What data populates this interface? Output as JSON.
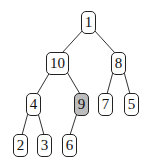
{
  "diagram": {
    "type": "binary-tree-heap",
    "highlight_color": "#bdbdbd",
    "nodes": [
      {
        "id": "n1",
        "label": "1",
        "x": 81,
        "y": 11,
        "w": 15,
        "h": 23,
        "highlighted": false
      },
      {
        "id": "n10",
        "label": "10",
        "x": 46,
        "y": 52,
        "w": 23,
        "h": 23,
        "highlighted": false
      },
      {
        "id": "n8",
        "label": "8",
        "x": 111,
        "y": 52,
        "w": 15,
        "h": 23,
        "highlighted": false
      },
      {
        "id": "n4",
        "label": "4",
        "x": 26,
        "y": 93,
        "w": 15,
        "h": 23,
        "highlighted": false
      },
      {
        "id": "n9",
        "label": "9",
        "x": 74,
        "y": 93,
        "w": 15,
        "h": 23,
        "highlighted": true
      },
      {
        "id": "n7",
        "label": "7",
        "x": 98,
        "y": 93,
        "w": 15,
        "h": 23,
        "highlighted": false
      },
      {
        "id": "n5",
        "label": "5",
        "x": 124,
        "y": 93,
        "w": 15,
        "h": 23,
        "highlighted": false
      },
      {
        "id": "n2",
        "label": "2",
        "x": 13,
        "y": 134,
        "w": 15,
        "h": 23,
        "highlighted": false
      },
      {
        "id": "n3",
        "label": "3",
        "x": 37,
        "y": 134,
        "w": 15,
        "h": 23,
        "highlighted": false
      },
      {
        "id": "n6",
        "label": "6",
        "x": 62,
        "y": 134,
        "w": 15,
        "h": 23,
        "highlighted": false
      }
    ],
    "edges": [
      [
        "n1",
        "n10"
      ],
      [
        "n1",
        "n8"
      ],
      [
        "n10",
        "n4"
      ],
      [
        "n10",
        "n9"
      ],
      [
        "n8",
        "n7"
      ],
      [
        "n8",
        "n5"
      ],
      [
        "n4",
        "n2"
      ],
      [
        "n4",
        "n3"
      ],
      [
        "n9",
        "n6"
      ]
    ]
  }
}
